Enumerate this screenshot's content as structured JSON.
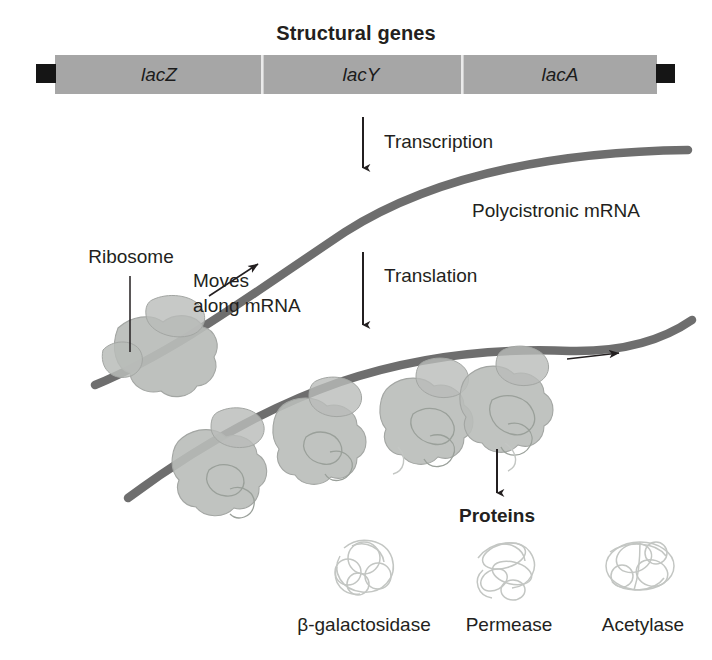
{
  "figure": {
    "title": "Structural genes",
    "background_color": "#ffffff",
    "text_color": "#231f20"
  },
  "operon": {
    "bar_color": "#a6a6a6",
    "divider_color": "#e8e8e8",
    "terminal_block_color": "#1a1a1a",
    "genes": [
      {
        "id": "lacZ",
        "label": "lacZ"
      },
      {
        "id": "lacY",
        "label": "lacY"
      },
      {
        "id": "lacA",
        "label": "lacA"
      }
    ]
  },
  "steps": {
    "transcription": "Transcription",
    "translation": "Translation",
    "proteins_heading": "Proteins"
  },
  "mrna": {
    "label": "Polycistronic mRNA",
    "strand_color": "#6e6e6e"
  },
  "annotations": {
    "ribosome": "Ribosome",
    "moves_line1": "Moves",
    "moves_line2": "along mRNA"
  },
  "proteins": [
    {
      "id": "beta-galactosidase",
      "label": "β-galactosidase"
    },
    {
      "id": "permease",
      "label": "Permease"
    },
    {
      "id": "acetylase",
      "label": "Acetylase"
    }
  ],
  "colors": {
    "ribosome_fill": "#b9bcb9",
    "ribosome_stroke": "#a0a3a0",
    "peptide_stroke": "#9aa09a",
    "protein_stroke": "#c3c6c3",
    "arrow_color": "#231f20"
  }
}
